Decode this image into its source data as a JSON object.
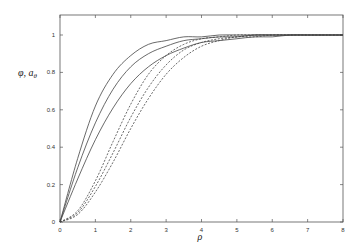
{
  "chart_data": {
    "type": "line",
    "title": "",
    "xlabel": "ρ",
    "ylabel": "φ, a_θ",
    "xlim": [
      0,
      8
    ],
    "ylim": [
      0,
      1
    ],
    "grid": false,
    "legend": null,
    "x_ticks": [
      "0",
      "1",
      "2",
      "3",
      "4",
      "5",
      "6",
      "7",
      "8"
    ],
    "y_ticks": [
      "0",
      "0.2",
      "0.4",
      "0.6",
      "0.8",
      "1"
    ],
    "x": [
      0,
      0.5,
      1,
      1.5,
      2,
      2.5,
      3,
      3.5,
      4,
      4.5,
      5,
      5.5,
      6,
      6.5,
      7,
      7.5,
      8
    ],
    "series": [
      {
        "name": "φ (1)",
        "style": "solid",
        "values": [
          0,
          0.34,
          0.62,
          0.79,
          0.89,
          0.95,
          0.97,
          0.99,
          0.99,
          1.0,
          1.0,
          1.0,
          1.0,
          1.0,
          1.0,
          1.0,
          1.0
        ]
      },
      {
        "name": "φ (2)",
        "style": "solid",
        "values": [
          0,
          0.29,
          0.53,
          0.71,
          0.83,
          0.9,
          0.94,
          0.97,
          0.98,
          0.99,
          0.99,
          1.0,
          1.0,
          1.0,
          1.0,
          1.0,
          1.0
        ]
      },
      {
        "name": "φ (3)",
        "style": "solid",
        "values": [
          0,
          0.23,
          0.44,
          0.61,
          0.74,
          0.83,
          0.89,
          0.93,
          0.96,
          0.97,
          0.98,
          0.99,
          0.99,
          1.0,
          1.0,
          1.0,
          1.0
        ]
      },
      {
        "name": "a_θ (1)",
        "style": "dashed",
        "values": [
          0,
          0.06,
          0.22,
          0.43,
          0.63,
          0.79,
          0.89,
          0.95,
          0.98,
          0.99,
          1.0,
          1.0,
          1.0,
          1.0,
          1.0,
          1.0,
          1.0
        ]
      },
      {
        "name": "a_θ (2)",
        "style": "dashed",
        "values": [
          0,
          0.05,
          0.19,
          0.37,
          0.56,
          0.72,
          0.84,
          0.92,
          0.96,
          0.98,
          0.99,
          1.0,
          1.0,
          1.0,
          1.0,
          1.0,
          1.0
        ]
      },
      {
        "name": "a_θ (3)",
        "style": "dashed",
        "values": [
          0,
          0.04,
          0.16,
          0.32,
          0.5,
          0.66,
          0.79,
          0.88,
          0.94,
          0.97,
          0.99,
          0.99,
          1.0,
          1.0,
          1.0,
          1.0,
          1.0
        ]
      }
    ]
  }
}
